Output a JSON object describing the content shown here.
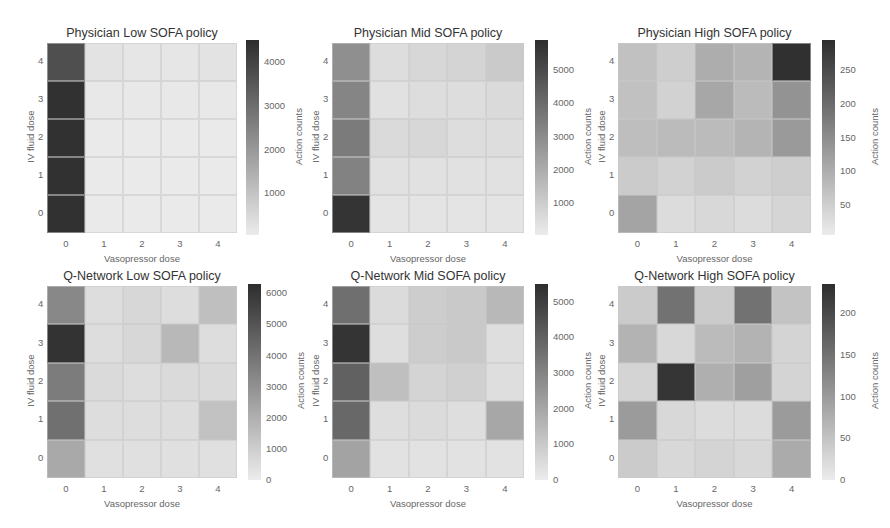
{
  "chart_data": [
    {
      "type": "heatmap",
      "title": "Physician Low SOFA policy",
      "xlabel": "Vasopressor dose",
      "ylabel": "IV fluid dose",
      "x_ticks": [
        "0",
        "1",
        "2",
        "3",
        "4"
      ],
      "y_ticks": [
        "4",
        "3",
        "2",
        "1",
        "0"
      ],
      "colorbar_label": "Action counts",
      "colorbar_ticks": [
        "4000",
        "3000",
        "2000",
        "1000"
      ],
      "vmin": 50,
      "vmax": 4500,
      "rows_top_to_bottom": [
        [
          3700,
          250,
          200,
          200,
          250
        ],
        [
          4400,
          150,
          150,
          150,
          150
        ],
        [
          4400,
          100,
          100,
          100,
          100
        ],
        [
          4400,
          100,
          100,
          100,
          100
        ],
        [
          4400,
          100,
          100,
          100,
          100
        ]
      ]
    },
    {
      "type": "heatmap",
      "title": "Physician Mid SOFA policy",
      "xlabel": "Vasopressor dose",
      "ylabel": "IV fluid dose",
      "x_ticks": [
        "0",
        "1",
        "2",
        "3",
        "4"
      ],
      "y_ticks": [
        "4",
        "3",
        "2",
        "1",
        "0"
      ],
      "colorbar_label": "Action counts",
      "colorbar_ticks": [
        "5000",
        "4000",
        "3000",
        "2000",
        "1000"
      ],
      "vmin": 50,
      "vmax": 5900,
      "rows_top_to_bottom": [
        [
          2900,
          500,
          700,
          800,
          1100
        ],
        [
          3200,
          400,
          500,
          500,
          600
        ],
        [
          3500,
          600,
          700,
          500,
          500
        ],
        [
          3300,
          400,
          400,
          400,
          400
        ],
        [
          5700,
          300,
          300,
          300,
          300
        ]
      ]
    },
    {
      "type": "heatmap",
      "title": "Physician High SOFA policy",
      "xlabel": "Vasopressor dose",
      "ylabel": "IV fluid dose",
      "x_ticks": [
        "0",
        "1",
        "2",
        "3",
        "4"
      ],
      "y_ticks": [
        "4",
        "3",
        "2",
        "1",
        "0"
      ],
      "colorbar_label": "Action counts",
      "colorbar_ticks": [
        "250",
        "200",
        "150",
        "100",
        "50"
      ],
      "vmin": 5,
      "vmax": 295,
      "rows_top_to_bottom": [
        [
          70,
          50,
          100,
          90,
          290
        ],
        [
          70,
          45,
          110,
          80,
          140
        ],
        [
          75,
          80,
          80,
          90,
          130
        ],
        [
          55,
          45,
          55,
          45,
          50
        ],
        [
          115,
          30,
          35,
          30,
          40
        ]
      ]
    },
    {
      "type": "heatmap",
      "title": "Q-Network Low SOFA policy",
      "xlabel": "Vasopressor dose",
      "ylabel": "IV fluid dose",
      "x_ticks": [
        "0",
        "1",
        "2",
        "3",
        "4"
      ],
      "y_ticks": [
        "4",
        "3",
        "2",
        "1",
        "0"
      ],
      "colorbar_label": "Action counts",
      "colorbar_ticks": [
        "6000",
        "5000",
        "4000",
        "3000",
        "2000",
        "1000",
        "0"
      ],
      "vmin": 0,
      "vmax": 6300,
      "rows_top_to_bottom": [
        [
          3300,
          500,
          700,
          500,
          1500
        ],
        [
          6100,
          500,
          700,
          1700,
          500
        ],
        [
          3700,
          600,
          500,
          600,
          600
        ],
        [
          4100,
          500,
          500,
          500,
          1400
        ],
        [
          2200,
          400,
          400,
          400,
          400
        ]
      ]
    },
    {
      "type": "heatmap",
      "title": "Q-Network Mid SOFA policy",
      "xlabel": "Vasopressor dose",
      "ylabel": "IV fluid dose",
      "x_ticks": [
        "0",
        "1",
        "2",
        "3",
        "4"
      ],
      "y_ticks": [
        "4",
        "3",
        "2",
        "1",
        "0"
      ],
      "colorbar_label": "Action counts",
      "colorbar_ticks": [
        "5000",
        "4000",
        "3000",
        "2000",
        "1000",
        "0"
      ],
      "vmin": 0,
      "vmax": 5500,
      "rows_top_to_bottom": [
        [
          3600,
          500,
          900,
          1000,
          1500
        ],
        [
          5300,
          400,
          900,
          1000,
          400
        ],
        [
          4000,
          1300,
          700,
          800,
          400
        ],
        [
          3800,
          400,
          500,
          400,
          2000
        ],
        [
          2100,
          300,
          300,
          300,
          300
        ]
      ]
    },
    {
      "type": "heatmap",
      "title": "Q-Network High SOFA policy",
      "xlabel": "Vasopressor dose",
      "ylabel": "IV fluid dose",
      "x_ticks": [
        "0",
        "1",
        "2",
        "3",
        "4"
      ],
      "y_ticks": [
        "4",
        "3",
        "2",
        "1",
        "0"
      ],
      "colorbar_label": "Action counts",
      "colorbar_ticks": [
        "200",
        "150",
        "100",
        "50",
        "0"
      ],
      "vmin": 0,
      "vmax": 235,
      "rows_top_to_bottom": [
        [
          40,
          150,
          40,
          150,
          50
        ],
        [
          70,
          25,
          60,
          70,
          30
        ],
        [
          30,
          225,
          75,
          95,
          30
        ],
        [
          100,
          25,
          20,
          20,
          100
        ],
        [
          40,
          25,
          30,
          25,
          80
        ]
      ]
    }
  ],
  "layout": {
    "panels": [
      {
        "gx": 47,
        "gy": 43,
        "gw": 190,
        "gh": 190,
        "cbx": 246,
        "cby": 40,
        "cbh": 195
      },
      {
        "gx": 332,
        "gy": 43,
        "gw": 192,
        "gh": 190,
        "cbx": 535,
        "cby": 40,
        "cbh": 195
      },
      {
        "gx": 618,
        "gy": 43,
        "gw": 193,
        "gh": 190,
        "cbx": 822,
        "cby": 40,
        "cbh": 195
      },
      {
        "gx": 47,
        "gy": 286,
        "gw": 190,
        "gh": 192,
        "cbx": 248,
        "cby": 284,
        "cbh": 196
      },
      {
        "gx": 332,
        "gy": 286,
        "gw": 192,
        "gh": 192,
        "cbx": 535,
        "cby": 284,
        "cbh": 196
      },
      {
        "gx": 618,
        "gy": 286,
        "gw": 193,
        "gh": 192,
        "cbx": 822,
        "cby": 284,
        "cbh": 196
      }
    ]
  }
}
